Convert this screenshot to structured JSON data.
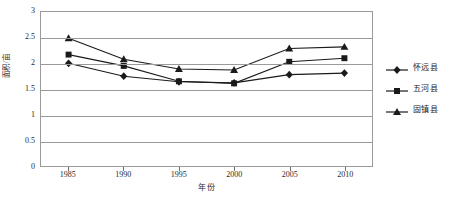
{
  "chart_data": {
    "type": "line",
    "title": "",
    "xlabel": "年份",
    "ylabel": "面积/亩",
    "x": [
      1985,
      1990,
      1995,
      2000,
      2005,
      2010
    ],
    "categories": [
      "1985",
      "1990",
      "1995",
      "2000",
      "2005",
      "2010"
    ],
    "xlim": [
      1982.5,
      2012.5
    ],
    "ylim": [
      0,
      3
    ],
    "yticks": [
      0,
      0.5,
      1,
      1.5,
      2,
      2.5,
      3
    ],
    "ytick_labels": [
      "0",
      "0.5",
      "1",
      "1.5",
      "2",
      "2.5",
      "3"
    ],
    "grid": "horizontal",
    "legend_position": "right",
    "series": [
      {
        "name": "怀远县",
        "marker": "diamond",
        "color": "#1a1a1a",
        "values": [
          2.0,
          1.75,
          1.64,
          1.62,
          1.78,
          1.81
        ]
      },
      {
        "name": "五河县",
        "marker": "square",
        "color": "#1a1a1a",
        "values": [
          2.17,
          1.95,
          1.65,
          1.61,
          2.03,
          2.1
        ]
      },
      {
        "name": "固镇县",
        "marker": "triangle",
        "color": "#1a1a1a",
        "values": [
          2.49,
          2.08,
          1.89,
          1.87,
          2.29,
          2.32
        ]
      }
    ]
  },
  "legend": {
    "items": [
      {
        "label": "怀远县",
        "marker": "diamond-marker-icon"
      },
      {
        "label": "五河县",
        "marker": "square-marker-icon"
      },
      {
        "label": "固镇县",
        "marker": "triangle-marker-icon"
      }
    ]
  },
  "axes": {
    "x_title": "年份",
    "y_title": "面积/亩"
  },
  "colors": {
    "series": "#1a1a1a",
    "gridline": "#9a9a9a",
    "frame": "#9a9a9a",
    "background": "#ffffff",
    "text": "#2a2a2a"
  }
}
